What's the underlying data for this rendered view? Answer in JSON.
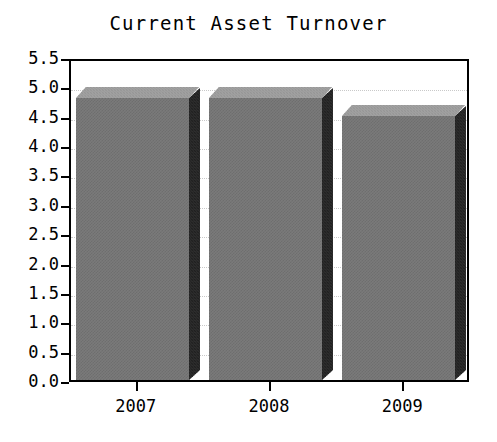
{
  "chart_data": {
    "type": "bar",
    "title": "Current Asset Turnover",
    "xlabel": "",
    "ylabel": "",
    "categories": [
      "2007",
      "2008",
      "2009"
    ],
    "values": [
      4.8,
      4.8,
      4.5
    ],
    "ylim": [
      0.0,
      5.5
    ],
    "ytick_labels": [
      "5.5",
      "5.0",
      "4.5",
      "4.0",
      "3.5",
      "3.0",
      "2.5",
      "2.0",
      "1.5",
      "1.0",
      "0.5",
      "0.0"
    ],
    "ytick_values": [
      5.5,
      5.0,
      4.5,
      4.0,
      3.5,
      3.0,
      2.5,
      2.0,
      1.5,
      1.0,
      0.5,
      0.0
    ],
    "grid": true,
    "legend": null,
    "style": {
      "bar_front_color": "#7a7a7a",
      "bar_top_color": "#a2a2a2",
      "bar_side_color": "#2e2e2e",
      "axis_color": "#000000",
      "grid_color": "#c9c9c9",
      "background_color": "#ffffff"
    }
  }
}
